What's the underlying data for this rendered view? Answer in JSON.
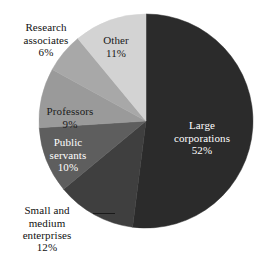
{
  "chart_data": {
    "type": "pie",
    "title": "",
    "subtitle": "",
    "xlabel": "",
    "ylabel": "",
    "legend_position": "none",
    "grid": false,
    "units": "percent",
    "start_angle_deg": 0,
    "direction": "clockwise",
    "categories": [
      "Large corporations",
      "Small and medium enterprises",
      "Public servants",
      "Professors",
      "Research associates",
      "Other"
    ],
    "values": [
      52,
      12,
      10,
      9,
      6,
      11
    ],
    "slices": [
      {
        "label": "Large corporations",
        "value": 52,
        "pct_text": "52%",
        "color": "#2b2b2b",
        "label_placement": "inside",
        "label_color": "#ffffff",
        "label_lines": "Large\ncorporations"
      },
      {
        "label": "Small and medium enterprises",
        "value": 12,
        "pct_text": "12%",
        "color": "#3f3f3f",
        "label_placement": "outside",
        "label_color": "#111111",
        "label_lines": "Small and\nmedium\nenterprises",
        "leader_line": true
      },
      {
        "label": "Public servants",
        "value": 10,
        "pct_text": "10%",
        "color": "#5e5e5e",
        "label_placement": "inside",
        "label_color": "#ffffff",
        "label_lines": "Public\nservants"
      },
      {
        "label": "Professors",
        "value": 9,
        "pct_text": "9%",
        "color": "#9a9a9a",
        "label_placement": "inside",
        "label_color": "#1a1a1a",
        "label_lines": "Professors"
      },
      {
        "label": "Research associates",
        "value": 6,
        "pct_text": "6%",
        "color": "#a8a8a8",
        "label_placement": "outside",
        "label_color": "#111111",
        "label_lines": "Research\nassociates"
      },
      {
        "label": "Other",
        "value": 11,
        "pct_text": "11%",
        "color": "#d3d3d3",
        "label_placement": "inside",
        "label_color": "#1a1a1a",
        "label_lines": "Other"
      }
    ],
    "geometry": {
      "center_x": 146,
      "center_y": 121,
      "radius": 107
    },
    "background_color": "#ffffff"
  },
  "labels": {
    "large_corporations": {
      "name": "Large\ncorporations",
      "pct": "52%"
    },
    "sme": {
      "name": "Small and\nmedium\nenterprises",
      "pct": "12%"
    },
    "public_servants": {
      "name": "Public\nservants",
      "pct": "10%"
    },
    "professors": {
      "name": "Professors",
      "pct": "9%"
    },
    "research_associates": {
      "name": "Research\nassociates",
      "pct": "6%"
    },
    "other": {
      "name": "Other",
      "pct": "11%"
    }
  }
}
